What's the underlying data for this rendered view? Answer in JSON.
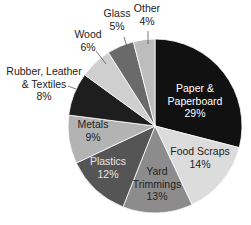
{
  "chart_data": {
    "type": "pie",
    "title": "",
    "start_angle_deg": 0,
    "direction": "clockwise",
    "slices": [
      {
        "label": "Paper & Paperboard",
        "lines": [
          "Paper &",
          "Paperboard",
          "29%"
        ],
        "value": 29,
        "color": "#111111",
        "text_color": "#ffffff",
        "label_pos": [
          195,
          92
        ],
        "inside": true
      },
      {
        "label": "Food Scraps",
        "lines": [
          "Food Scraps",
          "14%"
        ],
        "value": 14,
        "color": "#dcdcdc",
        "text_color": "#222222",
        "label_pos": [
          200,
          155
        ],
        "inside": true
      },
      {
        "label": "Yard Trimmings",
        "lines": [
          "Yard",
          "Trimmings",
          "13%"
        ],
        "value": 13,
        "color": "#8c8c8c",
        "text_color": "#222222",
        "label_pos": [
          157,
          175
        ],
        "inside": true
      },
      {
        "label": "Plastics",
        "lines": [
          "Plastics",
          "12%"
        ],
        "value": 12,
        "color": "#555555",
        "text_color": "#e6e6e6",
        "label_pos": [
          108,
          165
        ],
        "inside": true
      },
      {
        "label": "Metals",
        "lines": [
          "Metals",
          "9%"
        ],
        "value": 9,
        "color": "#b3b3b3",
        "text_color": "#222222",
        "label_pos": [
          93,
          128
        ],
        "inside": true
      },
      {
        "label": "Rubber, Leather & Textiles",
        "lines": [
          "Rubber, Leather",
          "& Textiles",
          "8%"
        ],
        "value": 8,
        "color": "#1e1e1e",
        "text_color": "#222222",
        "label_pos": [
          44,
          75
        ],
        "inside": false,
        "leader": [
          [
            68,
            86
          ],
          [
            76,
            89
          ]
        ]
      },
      {
        "label": "Wood",
        "lines": [
          "Wood",
          "6%"
        ],
        "value": 6,
        "color": "#cfcfcf",
        "text_color": "#222222",
        "label_pos": [
          88,
          38
        ],
        "inside": false,
        "leader": [
          [
            96,
            51
          ],
          [
            106,
            64
          ]
        ]
      },
      {
        "label": "Glass",
        "lines": [
          "Glass",
          "5%"
        ],
        "value": 5,
        "color": "#6a6a6a",
        "text_color": "#222222",
        "label_pos": [
          117,
          17
        ],
        "inside": false,
        "leader": [
          [
            124,
            37
          ],
          [
            127,
            47
          ]
        ]
      },
      {
        "label": "Other",
        "lines": [
          "Other",
          "4%"
        ],
        "value": 4,
        "color": "#bdbdbd",
        "text_color": "#222222",
        "label_pos": [
          147,
          12
        ],
        "inside": false,
        "leader": [
          [
            148,
            31
          ],
          [
            148,
            44
          ]
        ]
      }
    ],
    "center": [
      155,
      126
    ],
    "radius": 87,
    "legend": "none"
  }
}
